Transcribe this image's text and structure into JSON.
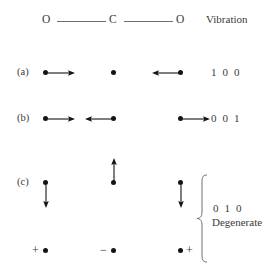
{
  "figure": {
    "background": "#ffffff",
    "ink": "#2b2b2b"
  },
  "header": {
    "molecule": {
      "left_atom": "O",
      "center_atom": "C",
      "right_atom": "O",
      "bond_left": "single-bond-line",
      "bond_right": "single-bond-line"
    },
    "column_heading": "Vibration"
  },
  "rows": [
    {
      "id": "a",
      "row_label": "(a)",
      "mode_name": "symmetric-stretch",
      "quantum_numbers": "1 0 0",
      "atoms": [
        {
          "name": "oxygen-left",
          "arrow": "right",
          "arrow_length": 26
        },
        {
          "name": "carbon",
          "arrow": "none",
          "arrow_length": 0
        },
        {
          "name": "oxygen-right",
          "arrow": "left",
          "arrow_length": 26
        }
      ]
    },
    {
      "id": "b",
      "row_label": "(b)",
      "mode_name": "antisymmetric-stretch",
      "quantum_numbers": "0 0 1",
      "atoms": [
        {
          "name": "oxygen-left",
          "arrow": "right",
          "arrow_length": 26
        },
        {
          "name": "carbon",
          "arrow": "left",
          "arrow_length": 26
        },
        {
          "name": "oxygen-right",
          "arrow": "right",
          "arrow_length": 26
        }
      ]
    },
    {
      "id": "c",
      "row_label": "(c)",
      "mode_name": "bending-degenerate-pair",
      "quantum_numbers": "0 1 0",
      "degenerate_label": "Degenerate",
      "in_plane": [
        {
          "name": "oxygen-left",
          "arrow": "down",
          "arrow_length": 22
        },
        {
          "name": "carbon",
          "arrow": "up",
          "arrow_length": 22
        },
        {
          "name": "oxygen-right",
          "arrow": "down",
          "arrow_length": 22
        }
      ],
      "out_of_plane": [
        {
          "name": "oxygen-left",
          "sign": "+",
          "sign_side": "left"
        },
        {
          "name": "carbon",
          "sign": "−",
          "sign_side": "left"
        },
        {
          "name": "oxygen-right",
          "sign": "+",
          "sign_side": "right"
        }
      ]
    }
  ]
}
